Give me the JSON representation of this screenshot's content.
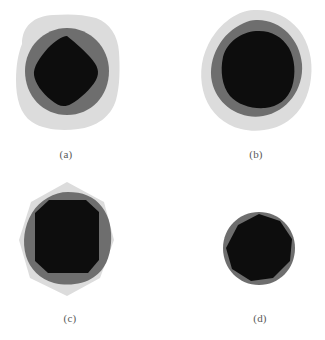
{
  "figure": {
    "background_color": "#ffffff",
    "width": 325,
    "height": 340,
    "label_color": "#595959"
  },
  "palette": {
    "outer_light_gray": "#dcdcdc",
    "middle_dark_gray": "#6e6e6e",
    "inner_black": "#0d0d0d",
    "background_white": "#ffffff"
  },
  "panels": [
    {
      "id": "a",
      "label": "(a)",
      "outer_shape": "rounded-square",
      "middle_shape": "circle",
      "inner_shape": "diamond",
      "inner_relative_area": "small"
    },
    {
      "id": "b",
      "label": "(b)",
      "outer_shape": "rounded-blob",
      "middle_shape": "circle",
      "inner_shape": "rounded-square-blob",
      "inner_relative_area": "large"
    },
    {
      "id": "c",
      "label": "(c)",
      "outer_shape": "heptagon",
      "middle_shape": "rounded-octagon",
      "inner_shape": "octagon",
      "inner_relative_area": "large"
    },
    {
      "id": "d",
      "label": "(d)",
      "outer_shape": "none",
      "middle_shape": "circle",
      "inner_shape": "nonagon",
      "inner_relative_area": "dominant"
    }
  ]
}
